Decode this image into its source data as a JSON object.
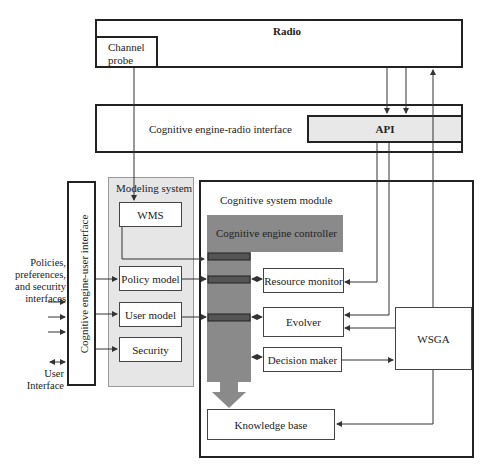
{
  "radio": {
    "title": "Radio",
    "channel_probe": "Channel probe"
  },
  "radio_interface": {
    "title": "Cognitive engine-radio interface",
    "api": "API"
  },
  "user_interface": {
    "title": "Cognitive engine-user interface"
  },
  "left_labels": {
    "policies": "Policies, preferences, and security interfaces",
    "policies_lines": [
      "Policies,",
      "preferences,",
      "and security",
      "interfaces"
    ],
    "user_interface_lines": [
      "User",
      "Interface"
    ]
  },
  "modeling_system": {
    "title": "Modeling system",
    "items": [
      "WMS",
      "Policy model",
      "User model",
      "Security"
    ]
  },
  "cognitive_system_module": {
    "title": "Cognitive system module",
    "controller": "Cognitive engine controller",
    "resource_monitor": "Resource monitor",
    "evolver": "Evolver",
    "decision_maker": "Decision maker",
    "wsga": "WSGA",
    "knowledge_base": "Knowledge base"
  },
  "colors": {
    "controller_fill": "#8a8a8a",
    "modeling_fill": "#e6e6e6",
    "api_fill": "#e8e8e8",
    "port_fill": "#555555"
  }
}
